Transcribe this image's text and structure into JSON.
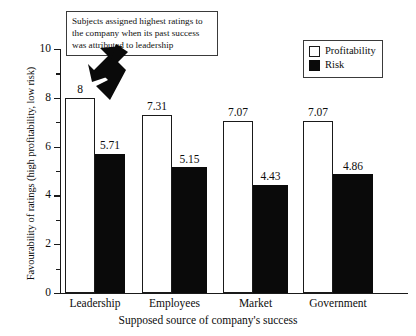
{
  "chart_data": {
    "type": "bar",
    "title": "",
    "categories": [
      "Leadership",
      "Employees",
      "Market",
      "Government"
    ],
    "series": [
      {
        "name": "Profitability",
        "values": [
          8,
          7.31,
          7.07,
          7.07
        ],
        "labels": [
          "8",
          "7.31",
          "7.07",
          "7.07"
        ],
        "color": "#ffffff"
      },
      {
        "name": "Risk",
        "values": [
          5.71,
          5.15,
          4.43,
          4.86
        ],
        "labels": [
          "5.71",
          "5.15",
          "4.43",
          "4.86"
        ],
        "color": "#0a0a0a"
      }
    ],
    "xlabel": "Supposed source of company's success",
    "ylabel": "Favourability of ratings (high profitability, low risk)",
    "ylim": [
      0,
      10
    ],
    "ytick_labels": [
      "0",
      "2",
      "4",
      "6",
      "8",
      "10"
    ],
    "ytick_values": [
      0,
      2,
      4,
      6,
      8,
      10
    ],
    "yminor_values": [
      1,
      3,
      5,
      7,
      9
    ],
    "grid": false,
    "legend_position": "top-right",
    "annotations": [
      {
        "text": "Subjects assigned highest ratings to the company when its past success was attributed to leadership",
        "lines": [
          "Subjects assigned highest ratings to",
          "the company when its past success",
          "was attributed to leadership"
        ],
        "points_to": [
          "Leadership Profitability bar",
          "Leadership Risk bar"
        ]
      }
    ]
  },
  "legend": {
    "items": [
      {
        "label": "Profitability",
        "swatch": "white-square-outline"
      },
      {
        "label": "Risk",
        "swatch": "black-filled-square"
      }
    ]
  },
  "axes": {
    "y_title": "Favourability of ratings (high profitability, low risk)",
    "x_title": "Supposed source of company's success"
  },
  "icons": {
    "arrow_one": "arrow-down-left-icon",
    "arrow_two": "arrow-down-icon"
  }
}
